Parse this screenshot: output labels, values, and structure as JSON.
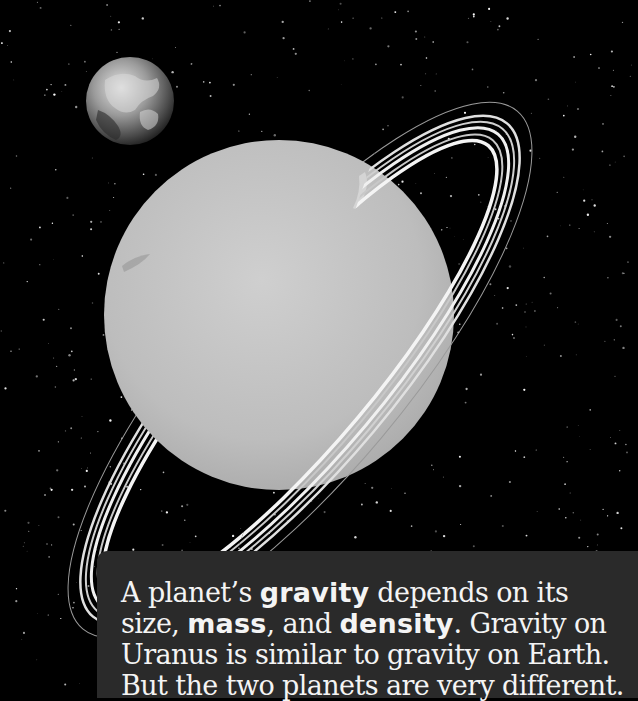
{
  "scene": {
    "background_color": "#000000",
    "objects": [
      {
        "name": "Earth",
        "icon": "earth-icon"
      },
      {
        "name": "Uranus",
        "icon": "uranus-planet"
      },
      {
        "name": "Uranus rings",
        "icon": "ring-icon"
      }
    ],
    "colors": {
      "uranus_fill": "#c4c4c4",
      "ring": "#e8e8e8",
      "caption_bg": "#2a2a2a",
      "caption_text": "#f4f4f4"
    }
  },
  "caption": {
    "segments": [
      {
        "text": "A planet’s ",
        "bold": false
      },
      {
        "text": "gravity",
        "bold": true
      },
      {
        "text": " depends on its size, ",
        "bold": false
      },
      {
        "text": "mass",
        "bold": true
      },
      {
        "text": ", and ",
        "bold": false
      },
      {
        "text": "density",
        "bold": true
      },
      {
        "text": ". Gravity on Uranus is similar to gravity on Earth. But the two planets are very different.",
        "bold": false
      }
    ],
    "full_text": "A planet’s gravity depends on its size, mass, and density. Gravity on Uranus is similar to gravity on Earth. But the two planets are very different.",
    "keywords": [
      "gravity",
      "mass",
      "density"
    ]
  }
}
